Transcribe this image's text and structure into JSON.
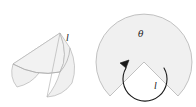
{
  "figure": {
    "background_color": "#ffffff",
    "fill_color": "#f0f0f0",
    "stroke_color": "#b0b0b0",
    "dark_stroke_color": "#1a1a1a",
    "labels": {
      "cone_slant_label": "l",
      "sector_slant_label": "l",
      "sector_angle_label": "θ"
    },
    "left_figure": {
      "name": "cone",
      "description": "Three-dimensional cone drawn in perspective with visible slant edge and elliptical base",
      "apex": [
        60,
        33
      ],
      "slant_label": "l",
      "slant_label_position": [
        68,
        39
      ]
    },
    "right_figure": {
      "name": "circular-sector",
      "description": "Circular sector (unrolled cone surface) with a V notch cut from the bottom, angle theta marked by a curved arrow",
      "center": [
        144,
        62
      ],
      "radius": 48,
      "angle_label": "θ",
      "angle_label_position": [
        141,
        34
      ],
      "slant_label": "l",
      "slant_label_position": [
        156,
        85
      ],
      "arrow_direction": "counterclockwise"
    }
  }
}
